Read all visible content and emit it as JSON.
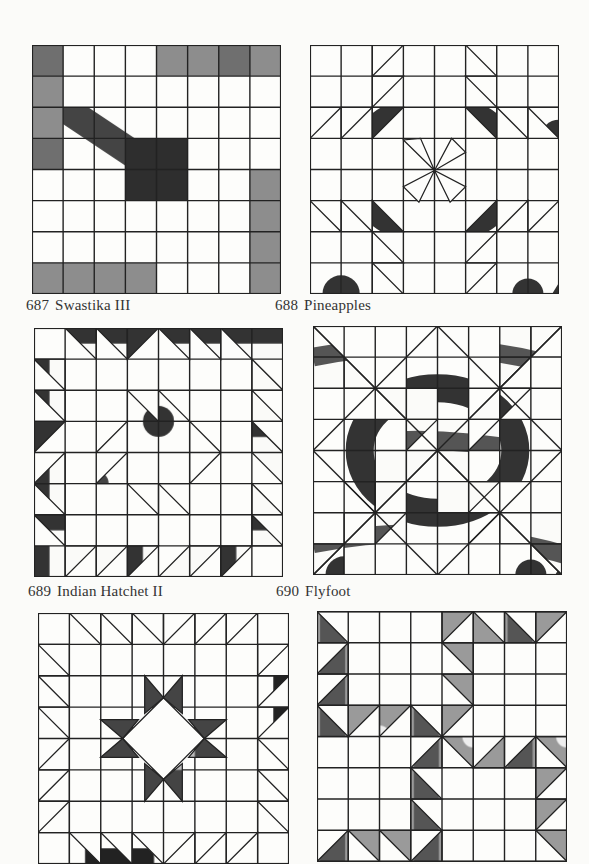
{
  "page": {
    "background": "#fbfbf9",
    "ink": "#222222"
  },
  "blocks": [
    {
      "id": "687",
      "number": "687",
      "name": "Swastika III",
      "grid": 8,
      "x": 32,
      "y": 45,
      "size": 247,
      "caption_x": 26,
      "caption_y": 297,
      "cells": [
        "D W W W D D D D",
        "D W W W S S W W",
        "D S S S S S W W",
        "D S S K K S W W",
        "W W S K K S S D",
        "W W S S S S S D",
        "W W S S W W W D",
        "D D D D W W W D"
      ],
      "fills": {
        "D": "dark-gray",
        "S": "scatter-dash",
        "K": "dense-black",
        "W": "white"
      }
    },
    {
      "id": "688",
      "number": "688",
      "name": "Pineapples",
      "grid": 8,
      "x": 310,
      "y": 45,
      "size": 247,
      "caption_x": 275,
      "caption_y": 297,
      "fills": {
        "P": "pebble"
      }
    },
    {
      "id": "689",
      "number": "689",
      "name": "Indian Hatchet II",
      "grid": 8,
      "x": 34,
      "y": 328,
      "size": 247,
      "caption_x": 28,
      "caption_y": 583,
      "fills": {
        "H": "crosshatch",
        "T": "fine-dot"
      }
    },
    {
      "id": "690",
      "number": "690",
      "name": "Flyfoot",
      "grid": 8,
      "x": 313,
      "y": 326,
      "size": 247,
      "caption_x": 276,
      "caption_y": 583,
      "fills": {
        "P": "pebble",
        "F": "wood-grain"
      }
    },
    {
      "id": "691",
      "number": "",
      "name": "",
      "grid": 8,
      "x": 38,
      "y": 613,
      "size": 249,
      "fills": {
        "D": "dots",
        "K": "dark-hatch"
      }
    },
    {
      "id": "692",
      "number": "",
      "name": "",
      "grid": 8,
      "x": 317,
      "y": 611,
      "size": 248,
      "fills": {
        "V": "vertical-lines"
      }
    }
  ]
}
